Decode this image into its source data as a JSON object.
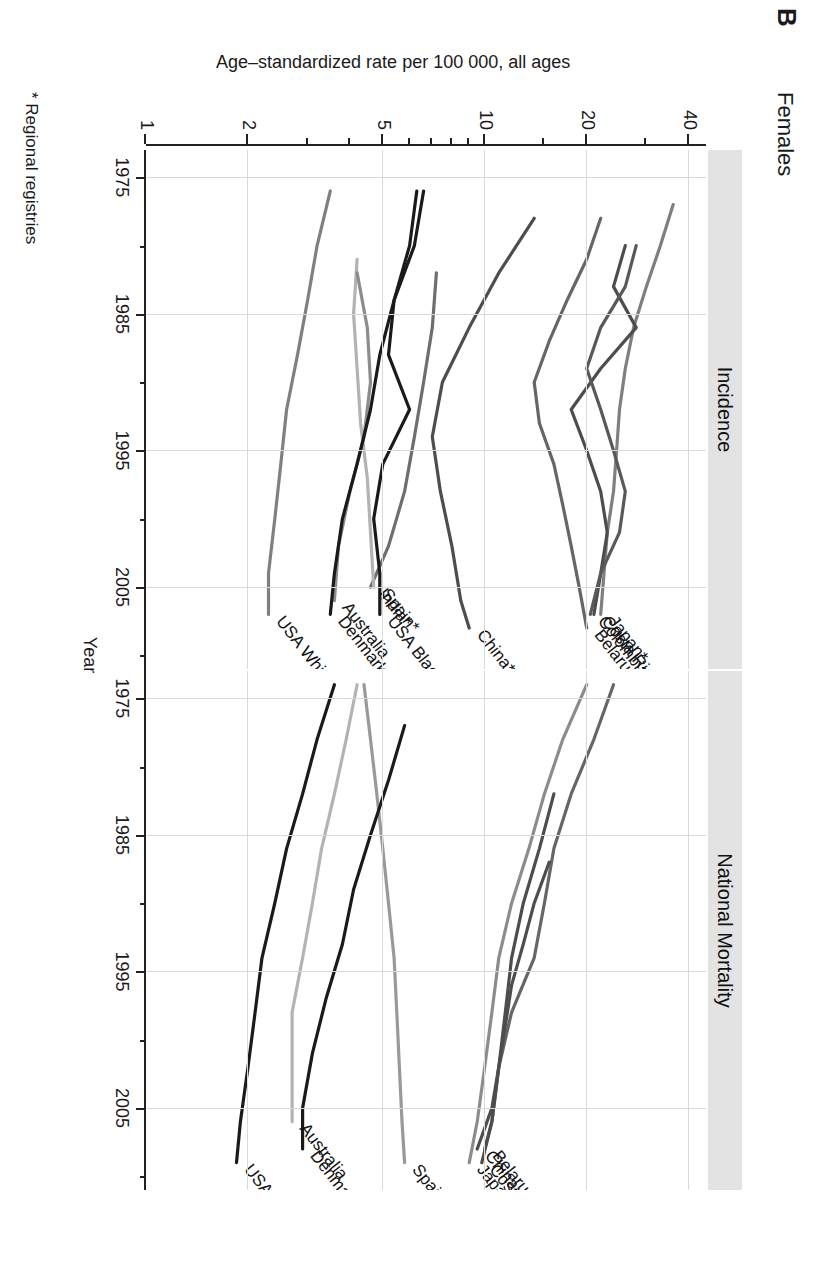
{
  "figure": {
    "panel_letter": "B",
    "title": "Females",
    "footnote": "* Regional registries"
  },
  "axes": {
    "x_title": "Year",
    "y_title": "Age–standardized rate per 100 000, all ages",
    "x_ticks": [
      1975,
      1985,
      1995,
      2005
    ],
    "x_minor_ticks": [
      1980,
      1990,
      2000,
      2010
    ],
    "y_ticks": [
      1,
      2,
      5,
      10,
      20,
      40
    ],
    "y_minor_ticks": [
      3,
      4,
      6,
      7,
      8,
      9,
      15,
      30
    ],
    "x_range": [
      1973,
      2011
    ],
    "y_range": [
      1,
      45
    ],
    "y_scale": "log"
  },
  "facets": [
    {
      "id": "incidence",
      "label": "Incidence"
    },
    {
      "id": "mortality",
      "label": "National Mortality"
    }
  ],
  "chart_data": {
    "type": "line",
    "title": "Females",
    "subtitle": "Cervical cancer age-standardized rates, incidence and national mortality",
    "xlabel": "Year",
    "ylabel": "Age–standardized rate per 100 000, all ages",
    "yscale": "log",
    "xlim": [
      1973,
      2011
    ],
    "ylim": [
      1,
      45
    ],
    "grid": true,
    "legend": "inline-endpoint-labels",
    "panels": [
      {
        "name": "Incidence",
        "series": [
          {
            "name": "Japan*",
            "color": "#7f7f7f",
            "label_anchor": "end",
            "x": [
              1977,
              1980,
              1983,
              1986,
              1989,
              1992,
              1995,
              1998,
              2001,
              2004,
              2007
            ],
            "y": [
              36.0,
              33.0,
              30.0,
              27.5,
              26.0,
              25.0,
              24.5,
              24.0,
              23.0,
              22.5,
              22.0
            ]
          },
          {
            "name": "Costa Rica",
            "color": "#4d4d4d",
            "label_anchor": "end",
            "x": [
              1980,
              1983,
              1986,
              1989,
              1992,
              1995,
              1998,
              2001,
              2004,
              2007
            ],
            "y": [
              26.0,
              24.0,
              28.0,
              22.0,
              18.0,
              20.0,
              22.0,
              23.0,
              22.0,
              21.0
            ]
          },
          {
            "name": "Colombia*",
            "color": "#595959",
            "label_anchor": "end",
            "x": [
              1980,
              1983,
              1986,
              1989,
              1992,
              1995,
              1998,
              2001,
              2004,
              2007
            ],
            "y": [
              28.0,
              26.0,
              22.0,
              20.0,
              22.0,
              24.0,
              26.0,
              25.0,
              22.0,
              20.5
            ]
          },
          {
            "name": "Belarus",
            "color": "#666666",
            "label_anchor": "end",
            "x": [
              1978,
              1981,
              1984,
              1987,
              1990,
              1993,
              1996,
              1999,
              2002,
              2005,
              2008
            ],
            "y": [
              22.0,
              20.0,
              17.5,
              15.5,
              14.0,
              14.5,
              16.0,
              17.0,
              18.0,
              19.0,
              20.0
            ]
          },
          {
            "name": "China*",
            "color": "#4d4d4d",
            "label_anchor": "end",
            "x": [
              1978,
              1982,
              1986,
              1990,
              1994,
              1998,
              2002,
              2006,
              2008
            ],
            "y": [
              14.0,
              11.0,
              9.0,
              7.5,
              7.0,
              7.4,
              8.0,
              8.5,
              9.0
            ]
          },
          {
            "name": "India*",
            "color": "#6e6e6e",
            "label_anchor": "end",
            "x": [
              1982,
              1986,
              1990,
              1994,
              1998,
              2002,
              2005
            ],
            "y": [
              7.2,
              7.0,
              6.6,
              6.2,
              5.8,
              5.2,
              4.6
            ]
          },
          {
            "name": "USA Black*",
            "color": "#1a1a1a",
            "label_anchor": "end",
            "x": [
              1976,
              1980,
              1984,
              1988,
              1992,
              1996,
              2000,
              2004,
              2007
            ],
            "y": [
              6.6,
              6.2,
              5.4,
              5.2,
              6.0,
              5.0,
              4.7,
              4.9,
              4.9
            ]
          },
          {
            "name": "Spain*",
            "color": "#b3b3b3",
            "label_anchor": "end",
            "x": [
              1981,
              1985,
              1989,
              1993,
              1997,
              2001,
              2005
            ],
            "y": [
              4.2,
              4.1,
              4.2,
              4.3,
              4.5,
              4.6,
              4.7
            ]
          },
          {
            "name": "Australia",
            "color": "#8c8c8c",
            "label_anchor": "end",
            "x": [
              1982,
              1986,
              1990,
              1994,
              1998,
              2002,
              2006
            ],
            "y": [
              4.2,
              4.5,
              4.6,
              4.4,
              4.0,
              3.7,
              3.6
            ]
          },
          {
            "name": "Denmark",
            "color": "#1a1a1a",
            "label_anchor": "end",
            "x": [
              1976,
              1980,
              1984,
              1988,
              1992,
              1996,
              2000,
              2004,
              2007
            ],
            "y": [
              6.3,
              6.0,
              5.4,
              4.9,
              4.6,
              4.2,
              3.8,
              3.6,
              3.5
            ]
          },
          {
            "name": "USA White*",
            "color": "#808080",
            "label_anchor": "end",
            "x": [
              1976,
              1980,
              1984,
              1988,
              1992,
              1996,
              2000,
              2004,
              2007
            ],
            "y": [
              3.5,
              3.2,
              3.0,
              2.8,
              2.6,
              2.5,
              2.4,
              2.3,
              2.3
            ]
          }
        ]
      },
      {
        "name": "National Mortality",
        "series": [
          {
            "name": "Belarus",
            "color": "#666666",
            "label_anchor": "end",
            "x": [
              1974,
              1978,
              1982,
              1986,
              1990,
              1994,
              1998,
              2002,
              2006,
              2008
            ],
            "y": [
              24.0,
              21.0,
              18.0,
              16.0,
              15.0,
              14.0,
              12.0,
              11.0,
              10.5,
              10.0
            ]
          },
          {
            "name": "China",
            "color": "#4d4d4d",
            "label_anchor": "end",
            "x": [
              1987,
              1990,
              1993,
              1996,
              1999,
              2002,
              2005,
              2008
            ],
            "y": [
              15.5,
              14.0,
              13.0,
              12.0,
              11.5,
              11.0,
              10.5,
              9.5
            ]
          },
          {
            "name": "Costa Rica",
            "color": "#4d4d4d",
            "label_anchor": "end",
            "x": [
              1982,
              1986,
              1990,
              1994,
              1998,
              2002,
              2006,
              2009
            ],
            "y": [
              16.0,
              14.5,
              13.0,
              12.0,
              11.5,
              11.0,
              10.5,
              9.8
            ]
          },
          {
            "name": "Japan",
            "color": "#8c8c8c",
            "label_anchor": "end",
            "x": [
              1974,
              1978,
              1982,
              1986,
              1990,
              1994,
              1998,
              2002,
              2006,
              2009
            ],
            "y": [
              20.0,
              17.0,
              15.0,
              13.5,
              12.0,
              11.0,
              10.5,
              10.0,
              9.5,
              9.0
            ]
          },
          {
            "name": "Spain",
            "color": "#999999",
            "label_anchor": "end",
            "x": [
              1974,
              1978,
              1982,
              1986,
              1990,
              1994,
              1998,
              2002,
              2006,
              2009
            ],
            "y": [
              4.4,
              4.6,
              4.8,
              5.0,
              5.2,
              5.4,
              5.5,
              5.6,
              5.7,
              5.8
            ]
          },
          {
            "name": "Denmark",
            "color": "#1a1a1a",
            "label_anchor": "end",
            "x": [
              1977,
              1981,
              1985,
              1989,
              1993,
              1997,
              2001,
              2005,
              2008
            ],
            "y": [
              5.8,
              5.2,
              4.6,
              4.1,
              3.8,
              3.4,
              3.1,
              2.9,
              2.9
            ]
          },
          {
            "name": "Australia",
            "color": "#b3b3b3",
            "label_anchor": "end",
            "x": [
              1974,
              1978,
              1982,
              1986,
              1990,
              1994,
              1998,
              2002,
              2006
            ],
            "y": [
              4.2,
              3.9,
              3.6,
              3.3,
              3.1,
              2.9,
              2.7,
              2.7,
              2.7
            ]
          },
          {
            "name": "USA",
            "color": "#1a1a1a",
            "label_anchor": "end",
            "x": [
              1974,
              1978,
              1982,
              1986,
              1990,
              1994,
              1998,
              2002,
              2006,
              2009
            ],
            "y": [
              3.6,
              3.2,
              2.9,
              2.6,
              2.4,
              2.2,
              2.1,
              2.0,
              1.9,
              1.85
            ]
          }
        ]
      }
    ]
  }
}
